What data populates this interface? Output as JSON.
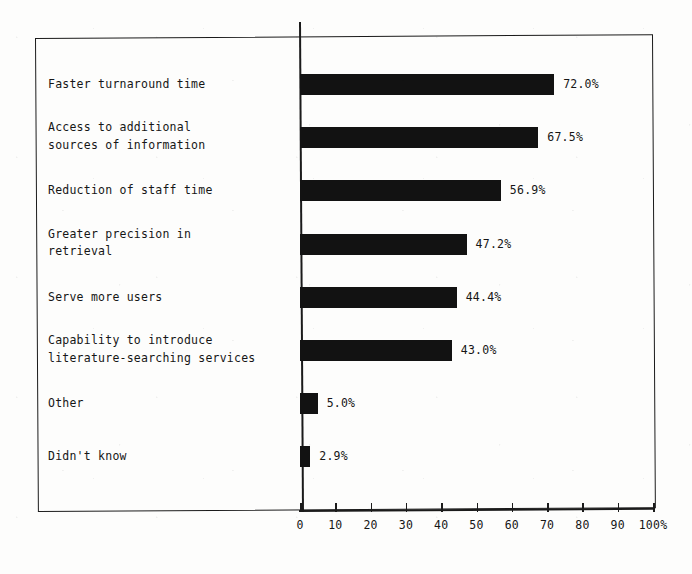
{
  "chart_data": {
    "type": "bar",
    "orientation": "horizontal",
    "title": "",
    "xlabel": "",
    "ylabel": "",
    "xlim": [
      0,
      100
    ],
    "grid": false,
    "legend": false,
    "axis_suffix": "%",
    "categories": [
      "Faster turnaround time",
      "Access to additional\nsources of information",
      "Reduction of staff time",
      "Greater precision in\nretrieval",
      "Serve more users",
      "Capability to introduce\nliterature-searching services",
      "Other",
      "Didn't know"
    ],
    "values": [
      72.0,
      67.5,
      56.9,
      47.2,
      44.4,
      43.0,
      5.0,
      2.9
    ],
    "value_labels": [
      "72.0%",
      "67.5%",
      "56.9%",
      "47.2%",
      "44.4%",
      "43.0%",
      "5.0%",
      "2.9%"
    ],
    "xticks": [
      0,
      10,
      20,
      30,
      40,
      50,
      60,
      70,
      80,
      90,
      100
    ],
    "xtick_labels": [
      "0",
      "10",
      "20",
      "30",
      "40",
      "50",
      "60",
      "70",
      "80",
      "90",
      "100%"
    ],
    "bar_color": "#121212",
    "axis_color": "#1b1b1b",
    "background_color": "#fdfdfc"
  }
}
